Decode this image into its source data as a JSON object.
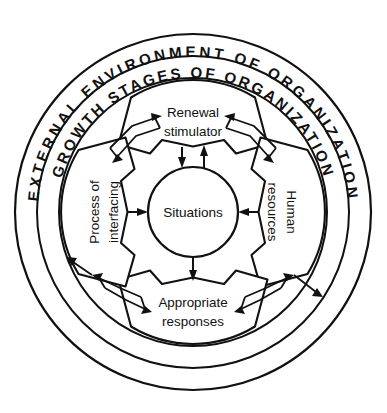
{
  "diagram": {
    "rings": [
      {
        "id": "outer-ring",
        "label": "EXTERNAL ENVIRONMENT OF ORGANIZATION"
      },
      {
        "id": "inner-ring",
        "label": "GROWTH STAGES OF ORGANIZATION"
      }
    ],
    "hub": {
      "label": "Situations"
    },
    "sectors": [
      {
        "id": "sector-top",
        "position": "top",
        "line1": "Renewal",
        "line2": "stimulator"
      },
      {
        "id": "sector-right",
        "position": "right",
        "line1": "Human",
        "line2": "resources"
      },
      {
        "id": "sector-bottom",
        "position": "bottom",
        "line1": "Appropriate",
        "line2": "responses"
      },
      {
        "id": "sector-left",
        "position": "left",
        "line1": "Process of",
        "line2": "interfacing"
      }
    ],
    "colors": {
      "stroke": "#111111",
      "background": "#ffffff"
    }
  }
}
